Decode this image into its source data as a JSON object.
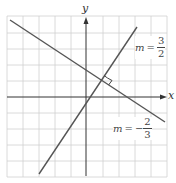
{
  "diagram": {
    "axes": {
      "x_label": "x",
      "y_label": "y"
    },
    "grid": {
      "cols": 10,
      "rows": 10,
      "cell_px": 16
    },
    "lines": [
      {
        "name": "line-positive-slope",
        "slope_label": {
          "m": "m",
          "eq": "=",
          "sign": "",
          "num": "3",
          "den": "2"
        }
      },
      {
        "name": "line-negative-slope",
        "slope_label": {
          "m": "m",
          "eq": "=",
          "sign": "−",
          "num": "2",
          "den": "3"
        }
      }
    ],
    "annotation": "right-angle-marker",
    "colors": {
      "grid": "#d0d0d0",
      "axis": "#333333",
      "line": "#555555"
    }
  }
}
